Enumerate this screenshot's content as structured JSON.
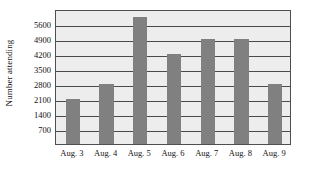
{
  "chart_data": {
    "type": "bar",
    "title": "",
    "subtitle": "",
    "xlabel": "",
    "ylabel": "Number attending",
    "categories": [
      "Aug. 3",
      "Aug. 4",
      "Aug. 5",
      "Aug. 6",
      "Aug. 7",
      "Aug. 8",
      "Aug. 9"
    ],
    "values": [
      2100,
      2800,
      5950,
      4200,
      4900,
      4900,
      2800
    ],
    "ylim": [
      0,
      6300
    ],
    "yticks": [
      700,
      1400,
      2100,
      2800,
      3500,
      4200,
      4900,
      5600
    ],
    "ytick_labels": [
      "700",
      "1400",
      "2100",
      "2800",
      "3500",
      "4200",
      "4900",
      "5600"
    ],
    "grid": true,
    "grid_axis": "y",
    "legend": false,
    "legend_position": "none",
    "bar_color": "#808080",
    "plot_background": "#ededed",
    "gridline_color": "#4a4a4a",
    "axis_border_color": "#4f4f4f",
    "page_background": "#ffffff",
    "text_color": "#111111"
  }
}
